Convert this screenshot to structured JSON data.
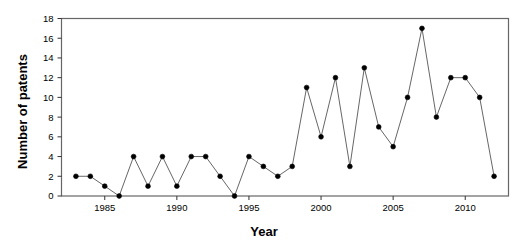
{
  "chart_data": {
    "type": "line",
    "title": "",
    "xlabel": "Year",
    "ylabel": "Number of patents",
    "xlim": [
      1982,
      2013
    ],
    "ylim": [
      0,
      18
    ],
    "xticks": [
      1985,
      1990,
      1995,
      2000,
      2005,
      2010
    ],
    "yticks": [
      0,
      2,
      4,
      6,
      8,
      10,
      12,
      14,
      16,
      18
    ],
    "grid": false,
    "legend": null,
    "marker": "filled-circle",
    "line_color": "#555555",
    "marker_color": "#000000",
    "x": [
      1983,
      1984,
      1985,
      1986,
      1987,
      1988,
      1989,
      1990,
      1991,
      1992,
      1993,
      1994,
      1995,
      1996,
      1997,
      1998,
      1999,
      2000,
      2001,
      2002,
      2003,
      2004,
      2005,
      2006,
      2007,
      2008,
      2009,
      2010,
      2011,
      2012
    ],
    "values": [
      2,
      2,
      1,
      0,
      4,
      1,
      4,
      1,
      4,
      4,
      2,
      0,
      4,
      3,
      2,
      3,
      11,
      6,
      12,
      3,
      13,
      7,
      5,
      10,
      17,
      8,
      12,
      12,
      10,
      2
    ],
    "series": [
      {
        "name": "Number of patents",
        "values": [
          2,
          2,
          1,
          0,
          4,
          1,
          4,
          1,
          4,
          4,
          2,
          0,
          4,
          3,
          2,
          3,
          11,
          6,
          12,
          3,
          13,
          7,
          5,
          10,
          17,
          8,
          12,
          12,
          10,
          2
        ]
      }
    ]
  },
  "axes": {
    "y_title": "Number of patents",
    "x_title": "Year"
  }
}
